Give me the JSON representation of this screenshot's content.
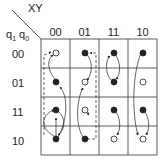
{
  "header": {
    "col_var_label": "XY",
    "row_var_label_q1": "q",
    "row_var_sub1": "1",
    "row_var_label_q0": "q",
    "row_var_sub0": "0"
  },
  "columns": [
    {
      "label": "00"
    },
    {
      "label": "01"
    },
    {
      "label": "11"
    },
    {
      "label": "10"
    }
  ],
  "rows": [
    {
      "label": "00",
      "cells": [
        "open",
        "filled",
        "filled",
        "filled"
      ]
    },
    {
      "label": "01",
      "cells": [
        "filled",
        "open",
        "filled",
        "open"
      ]
    },
    {
      "label": "11",
      "cells": [
        "filled",
        "open",
        "filled",
        "filled"
      ]
    },
    {
      "label": "10",
      "cells": [
        "filled",
        "filled",
        "open",
        "open"
      ]
    }
  ],
  "colors": {
    "line": "#222222",
    "grid": "#333333",
    "background": "#ffffff"
  }
}
